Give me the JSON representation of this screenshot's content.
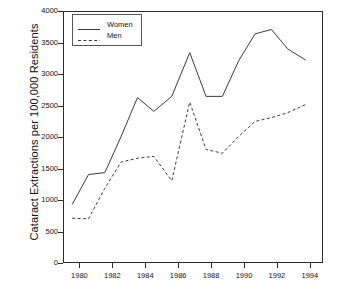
{
  "chart_data": {
    "type": "line",
    "title": "",
    "xlabel": "",
    "ylabel": "Cataract Extractions per 100,000 Residents",
    "xlim": [
      1979.0,
      1994.8
    ],
    "ylim": [
      0,
      4000
    ],
    "grid": false,
    "legend_position": "top-left",
    "xticks": [
      1980,
      1982,
      1984,
      1986,
      1988,
      1990,
      1992,
      1994
    ],
    "xticklabels": [
      "1980",
      "1982",
      "1984",
      "1986",
      "1988",
      "1990",
      "1992",
      "1994"
    ],
    "yticks": [
      0,
      500,
      1000,
      1500,
      2000,
      2500,
      3000,
      3500,
      4000
    ],
    "yticklabels": [
      "0",
      "500",
      "1000",
      "1500",
      "2000",
      "2500",
      "3000",
      "3500",
      "4000"
    ],
    "series": [
      {
        "name": "Women",
        "style": "solid",
        "color": "#3a3a3a",
        "x": [
          1979.5,
          1980.5,
          1981.5,
          1982.5,
          1983.5,
          1984.5,
          1985.6,
          1986.7,
          1987.7,
          1988.7,
          1989.7,
          1990.7,
          1991.7,
          1992.7,
          1993.8
        ],
        "values": [
          920,
          1400,
          1430,
          2010,
          2630,
          2410,
          2650,
          3350,
          2650,
          2650,
          3220,
          3650,
          3720,
          3410,
          3230
        ]
      },
      {
        "name": "Men",
        "style": "dashed",
        "color": "#3a3a3a",
        "x": [
          1979.5,
          1980.5,
          1981.5,
          1982.5,
          1983.5,
          1984.5,
          1985.6,
          1986.7,
          1987.7,
          1988.7,
          1989.7,
          1990.7,
          1991.7,
          1992.7,
          1993.8
        ],
        "values": [
          700,
          690,
          1180,
          1600,
          1660,
          1690,
          1300,
          2560,
          1800,
          1740,
          2010,
          2250,
          2310,
          2390,
          2520
        ]
      }
    ]
  },
  "legend": {
    "items": [
      {
        "label": "Women",
        "style": "solid"
      },
      {
        "label": "Men",
        "style": "dashed"
      }
    ]
  }
}
